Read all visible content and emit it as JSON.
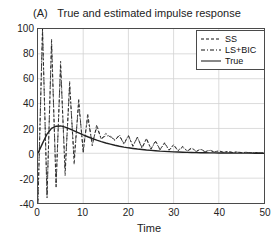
{
  "panel": {
    "label": "(A)"
  },
  "chart_data": {
    "type": "line",
    "title": "True and estimated impulse response",
    "xlabel": "Time",
    "ylabel": "",
    "xlim": [
      0,
      50
    ],
    "ylim": [
      -40,
      100
    ],
    "xticks": [
      0,
      10,
      20,
      30,
      40,
      50
    ],
    "yticks": [
      -40,
      -20,
      0,
      20,
      40,
      60,
      80,
      100
    ],
    "xticklabels": [
      "0",
      "10",
      "20",
      "30",
      "40",
      "50"
    ],
    "yticklabels": [
      "-40",
      "-20",
      "0",
      "20",
      "40",
      "60",
      "80",
      "100"
    ],
    "grid": true,
    "legend_position": "top-right",
    "legend": [
      {
        "name": "SS",
        "style": "dashed"
      },
      {
        "name": "LS+BIC",
        "style": "dash-dot"
      },
      {
        "name": "True",
        "style": "solid"
      }
    ],
    "x": [
      0,
      1,
      2,
      3,
      4,
      5,
      6,
      7,
      8,
      9,
      10,
      11,
      12,
      13,
      14,
      15,
      16,
      17,
      18,
      19,
      20,
      21,
      22,
      23,
      24,
      25,
      26,
      27,
      28,
      29,
      30,
      31,
      32,
      33,
      34,
      35,
      36,
      37,
      38,
      39,
      40,
      41,
      42,
      43,
      44,
      45,
      46,
      47,
      48,
      49,
      50
    ],
    "series": [
      {
        "name": "True",
        "style": "solid",
        "color": "#222222",
        "values": [
          0,
          8,
          15.5,
          20,
          21.8,
          22,
          21,
          19.6,
          18,
          16.4,
          14.8,
          13.3,
          11.9,
          10.6,
          9.4,
          8.3,
          7.4,
          6.5,
          5.7,
          5.0,
          4.4,
          3.9,
          3.4,
          3.0,
          2.6,
          2.3,
          2.0,
          1.7,
          1.5,
          1.3,
          1.1,
          1.0,
          0.85,
          0.74,
          0.64,
          0.55,
          0.48,
          0.41,
          0.36,
          0.31,
          0.27,
          0.23,
          0.2,
          0.17,
          0.15,
          0.13,
          0.11,
          0.1,
          0.08,
          0.07,
          0.06
        ]
      },
      {
        "name": "SS",
        "style": "dashed",
        "color": "#222222",
        "values": [
          -38,
          104,
          -36,
          92,
          -28,
          74,
          -18,
          58,
          -9,
          44,
          0,
          32,
          6,
          23,
          11,
          16,
          13,
          11,
          14,
          8,
          14,
          6,
          13,
          4.5,
          12,
          3.5,
          10,
          3,
          8.5,
          2.6,
          7,
          2.2,
          5.6,
          1.9,
          4.4,
          1.6,
          3.4,
          1.3,
          2.6,
          1.1,
          2.0,
          0.9,
          1.5,
          0.7,
          1.1,
          0.6,
          0.8,
          0.5,
          0.6,
          0.4,
          0.45
        ]
      },
      {
        "name": "LS+BIC",
        "style": "dash-dot",
        "color": "#222222",
        "values": [
          -40,
          110,
          -34,
          88,
          -24,
          70,
          -13,
          54,
          -4,
          40,
          3,
          29,
          8,
          21,
          12,
          14,
          14,
          10,
          15,
          7,
          14.5,
          5.5,
          13,
          4,
          11.5,
          3.2,
          9.5,
          2.7,
          8,
          2.4,
          6.4,
          2.0,
          5.0,
          1.7,
          3.9,
          1.4,
          3.0,
          1.2,
          2.3,
          1.0,
          1.8,
          0.8,
          1.3,
          0.65,
          1.0,
          0.5,
          0.7,
          0.42,
          0.55,
          0.35,
          0.4
        ]
      }
    ]
  }
}
